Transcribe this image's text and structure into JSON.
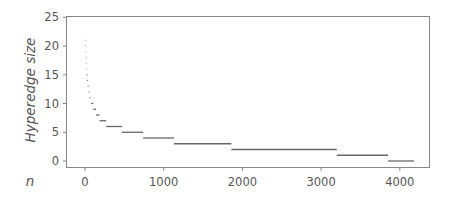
{
  "chart_data": {
    "type": "scatter",
    "title": "",
    "xlabel": "n",
    "ylabel": "Hyperedge size",
    "xlim": [
      -200,
      4400
    ],
    "ylim": [
      -1,
      25
    ],
    "xticks": [
      0,
      1000,
      2000,
      3000,
      4000
    ],
    "xtick_labels": [
      "0",
      "1000",
      "2000",
      "3000",
      "4000"
    ],
    "yticks": [
      0,
      5,
      10,
      15,
      20,
      25
    ],
    "ytick_labels": [
      "0",
      "5",
      "10",
      "15",
      "20",
      "25"
    ],
    "grid": false,
    "legend": null,
    "marker_color": "#666666",
    "segments": [
      {
        "size": 21,
        "n_start": 0,
        "n_end": 2
      },
      {
        "size": 20,
        "n_start": 2,
        "n_end": 4
      },
      {
        "size": 19,
        "n_start": 4,
        "n_end": 7
      },
      {
        "size": 18,
        "n_start": 7,
        "n_end": 10
      },
      {
        "size": 17,
        "n_start": 10,
        "n_end": 14
      },
      {
        "size": 16,
        "n_start": 14,
        "n_end": 19
      },
      {
        "size": 15,
        "n_start": 19,
        "n_end": 25
      },
      {
        "size": 14,
        "n_start": 25,
        "n_end": 33
      },
      {
        "size": 13,
        "n_start": 33,
        "n_end": 43
      },
      {
        "size": 12,
        "n_start": 43,
        "n_end": 58
      },
      {
        "size": 11,
        "n_start": 58,
        "n_end": 78
      },
      {
        "size": 10,
        "n_start": 78,
        "n_end": 105
      },
      {
        "size": 9,
        "n_start": 105,
        "n_end": 140
      },
      {
        "size": 8,
        "n_start": 140,
        "n_end": 185
      },
      {
        "size": 7,
        "n_start": 185,
        "n_end": 270
      },
      {
        "size": 6,
        "n_start": 270,
        "n_end": 470
      },
      {
        "size": 5,
        "n_start": 470,
        "n_end": 740
      },
      {
        "size": 4,
        "n_start": 740,
        "n_end": 1130
      },
      {
        "size": 3,
        "n_start": 1130,
        "n_end": 1860
      },
      {
        "size": 2,
        "n_start": 1860,
        "n_end": 3200
      },
      {
        "size": 1,
        "n_start": 3200,
        "n_end": 3850
      },
      {
        "size": 0,
        "n_start": 3850,
        "n_end": 4180
      }
    ]
  }
}
